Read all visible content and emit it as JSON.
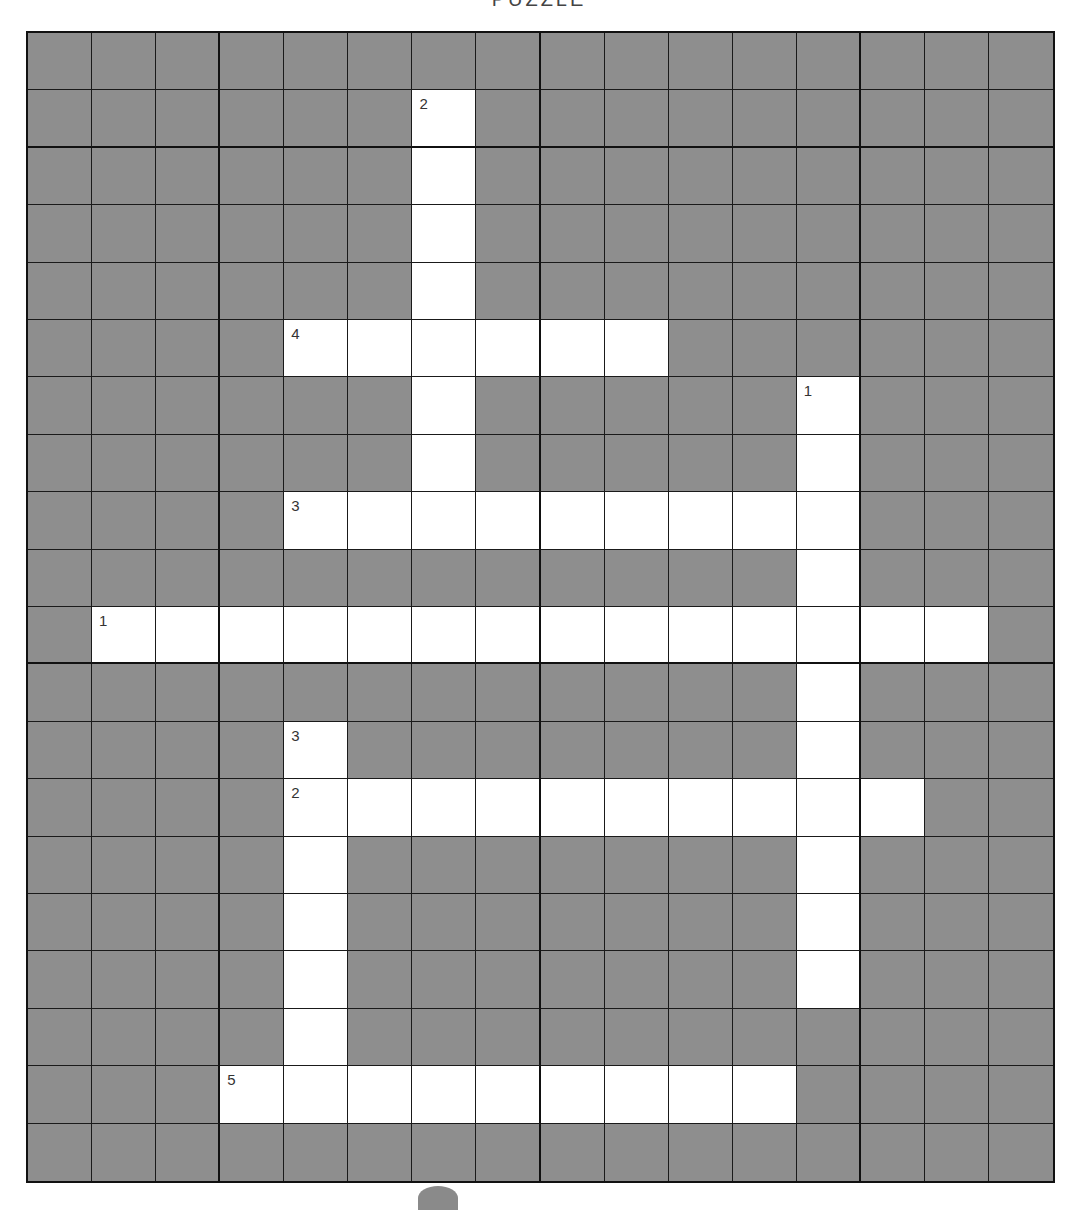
{
  "page": {
    "title": "PUZZLE"
  },
  "crossword": {
    "cols": 16,
    "rows": 20,
    "colors": {
      "block": "#8e8e8e",
      "open": "#ffffff",
      "line": "#1a1a1a"
    },
    "thick_cols": [
      2,
      7,
      12
    ],
    "thick_rows": [
      1,
      10
    ],
    "across": [
      {
        "number": "1",
        "row": 10,
        "col": 1,
        "length": 14
      },
      {
        "number": "2",
        "row": 13,
        "col": 4,
        "length": 10
      },
      {
        "number": "3",
        "row": 8,
        "col": 4,
        "length": 9
      },
      {
        "number": "4",
        "row": 5,
        "col": 4,
        "length": 6
      },
      {
        "number": "5",
        "row": 18,
        "col": 3,
        "length": 9
      }
    ],
    "down": [
      {
        "number": "1",
        "row": 6,
        "col": 12,
        "length": 11
      },
      {
        "number": "2",
        "row": 1,
        "col": 6,
        "length": 8
      },
      {
        "number": "3",
        "row": 12,
        "col": 4,
        "length": 7
      }
    ]
  }
}
